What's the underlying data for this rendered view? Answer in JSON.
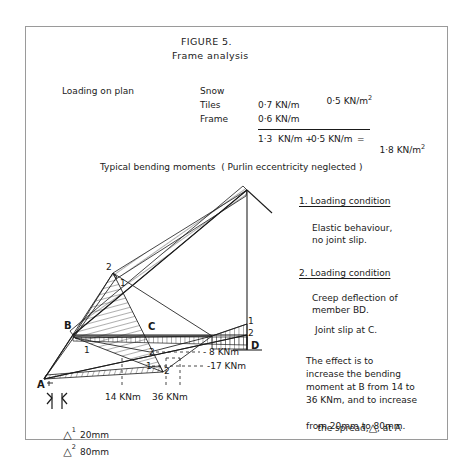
{
  "figure": {
    "title_line1": "FIGURE 5.",
    "title_line2": "Frame analysis"
  },
  "loading": {
    "caption": "Loading on plan",
    "rows": [
      {
        "name": "Snow",
        "col_left": "",
        "col_right": "0·5 KN/m"
      },
      {
        "name": "Tiles",
        "col_left": "0·7 KN/m",
        "col_right": ""
      },
      {
        "name": "Frame",
        "col_left": "0·6 KN/m",
        "col_right": ""
      }
    ],
    "snow_unit_superscript": "2",
    "total": {
      "dead": "1·3  KN/m +",
      "snow": "0·5 KN/m",
      "equals": "=",
      "result": "1·8 KN/m",
      "result_superscript": "2"
    }
  },
  "diagram": {
    "caption": "Typical bending moments  ( Purlin eccentricity neglected )",
    "nodes": [
      {
        "label": "A"
      },
      {
        "label": "B"
      },
      {
        "label": "C"
      },
      {
        "label": "D"
      }
    ],
    "case_markers": [
      "1",
      "2"
    ],
    "moment_labels": [
      {
        "case": "2",
        "value": "- 8 KNm"
      },
      {
        "case": "1",
        "value": "-17 KNm"
      }
    ],
    "base_dimensions": [
      {
        "value": "14 KNm"
      },
      {
        "value": "36 KNm"
      }
    ],
    "spread_annotations": [
      {
        "symbol": "△",
        "sub": "1",
        "value": "20mm"
      },
      {
        "symbol": "△",
        "sub": "2",
        "value": "80mm"
      }
    ]
  },
  "notes": {
    "condition1": {
      "heading": "1. Loading condition",
      "lines": [
        "Elastic behaviour,",
        "no joint slip."
      ]
    },
    "condition2": {
      "heading": "2. Loading condition",
      "lines": [
        "Creep deflection of",
        "member BD."
      ],
      "extra": "Joint slip at C."
    },
    "effect": {
      "line1": "The effect is to",
      "line2": "increase the bending",
      "line3": "moment at B from 14 to",
      "line4": "36 KNm, and to increase",
      "line5_a": "the spread,",
      "line5_symbol": "△",
      "line5_b": ", at A",
      "line6": "from 20mm to 80mm."
    }
  },
  "colors": {
    "ink": "#1a1a1a",
    "frame": "#9a9a9a",
    "paper": "#ffffff"
  }
}
